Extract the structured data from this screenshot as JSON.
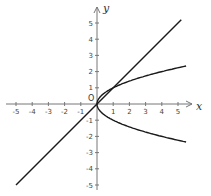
{
  "diagram": {
    "type": "coordinate-plane",
    "x_axis_label": "x",
    "y_axis_label": "y",
    "origin_label": "O",
    "x_ticks": [
      "-5",
      "-4",
      "-3",
      "-2",
      "-1",
      "1",
      "2",
      "3",
      "4",
      "5"
    ],
    "y_ticks": [
      "5",
      "4",
      "3",
      "2",
      "1",
      "-1",
      "-2",
      "-3",
      "-4",
      "-5"
    ],
    "curves": [
      {
        "name": "line",
        "equation": "y = x",
        "domain": [
          -5,
          5.2
        ]
      },
      {
        "name": "parabola",
        "equation": "y^2 = x",
        "domain": [
          0,
          5.5
        ]
      }
    ],
    "intersections": [
      "(0, 0)",
      "(1, 1)"
    ],
    "colors": {
      "curve": "#1a1a1a",
      "axis": "#777777"
    }
  }
}
